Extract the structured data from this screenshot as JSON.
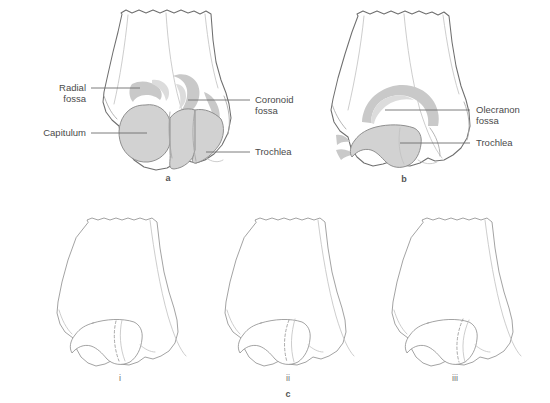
{
  "figure": {
    "background_color": "#ffffff",
    "shade_color": "#d2d2d2",
    "outline_color": "#6f6f6f",
    "label_color": "#4a4a4a"
  },
  "panels": [
    {
      "id": "a",
      "letter": "a",
      "view": "anterior",
      "labels": [
        {
          "name": "radial-fossa",
          "line1": "Radial",
          "line2": "fossa",
          "side": "left"
        },
        {
          "name": "capitulum",
          "line1": "Capitulum",
          "line2": "",
          "side": "left"
        },
        {
          "name": "coronoid-fossa",
          "line1": "Coronoid",
          "line2": "fossa",
          "side": "right"
        },
        {
          "name": "trochlea",
          "line1": "Trochlea",
          "line2": "",
          "side": "right"
        }
      ]
    },
    {
      "id": "b",
      "letter": "b",
      "view": "posterior",
      "labels": [
        {
          "name": "olecranon-fossa",
          "line1": "Olecranon",
          "line2": "fossa",
          "side": "right"
        },
        {
          "name": "trochlea",
          "line1": "Trochlea",
          "line2": "",
          "side": "right"
        }
      ]
    },
    {
      "id": "c",
      "letter": "c",
      "view": "outline-series",
      "labels": [],
      "sub_figures": [
        {
          "id": "i",
          "letter": "i"
        },
        {
          "id": "ii",
          "letter": "ii"
        },
        {
          "id": "iii",
          "letter": "iii"
        }
      ]
    }
  ],
  "text_items": {
    "radial_fossa_l1": "Radial",
    "radial_fossa_l2": "fossa",
    "capitulum": "Capitulum",
    "coronoid_fossa_l1": "Coronoid",
    "coronoid_fossa_l2": "fossa",
    "trochlea_a": "Trochlea",
    "olecranon_fossa_l1": "Olecranon",
    "olecranon_fossa_l2": "fossa",
    "trochlea_b": "Trochlea",
    "letter_a": "a",
    "letter_b": "b",
    "letter_c": "c",
    "numeral_i": "i",
    "numeral_ii": "ii",
    "numeral_iii": "iii"
  }
}
